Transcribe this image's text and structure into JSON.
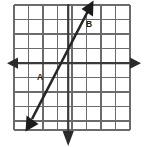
{
  "figure": {
    "background_color": "#ffffff"
  },
  "chart_data": {
    "type": "line",
    "title": "",
    "xlabel": "",
    "ylabel": "",
    "grid": true,
    "legend_position": "none",
    "xlim": [
      -4,
      4
    ],
    "ylim": [
      -4,
      4
    ],
    "grid_columns": 8,
    "grid_rows": 8,
    "grid_cell_size_px": 14.5,
    "grid_color": "#6b6b6b",
    "axis_color": "#3a3a3a",
    "line_color": "#262626",
    "axes": [
      {
        "name": "x-axis",
        "orientation": "horizontal",
        "arrowheads": "both",
        "y_value": 0
      },
      {
        "name": "y-axis",
        "orientation": "vertical",
        "arrowheads": "bottom",
        "x_value": 0
      }
    ],
    "series": [
      {
        "name": "graphed-line",
        "arrowheads": "both",
        "slope": 2,
        "y_intercept": -1,
        "x_intercept": 0.5,
        "endpoints": [
          {
            "x": -1.8,
            "y": -4.5
          },
          {
            "x": 1.7,
            "y": 2.4
          }
        ],
        "pixel_endpoints": [
          {
            "px": 27,
            "py": 128
          },
          {
            "px": 92,
            "py": 2
          }
        ]
      }
    ],
    "annotations": [
      {
        "id": "label-a",
        "text": "A",
        "x": -2,
        "y": -1,
        "px": 40,
        "py": 78,
        "position": "left of line, below x-axis"
      },
      {
        "id": "label-b",
        "text": "B",
        "x": 1.6,
        "y": 2.8,
        "px": 89,
        "py": 25,
        "position": "right of line, above x-axis"
      }
    ],
    "x_gridlines_px": [
      14,
      28.5,
      43,
      57.5,
      72,
      86.5,
      101,
      115.5,
      130
    ],
    "y_gridlines_px": [
      5,
      19.5,
      34,
      48.5,
      63,
      77.5,
      92,
      106.5,
      121,
      130
    ]
  }
}
